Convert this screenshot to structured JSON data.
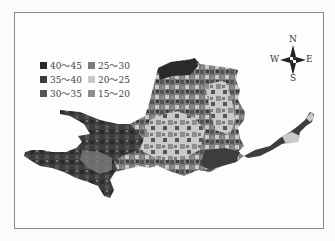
{
  "legend": {
    "items": [
      {
        "label": "40～45",
        "color": "#2a2a2a"
      },
      {
        "label": "35～40",
        "color": "#3d3d3d"
      },
      {
        "label": "30～35",
        "color": "#555555"
      },
      {
        "label": "25～30",
        "color": "#7a7a7a"
      },
      {
        "label": "20～25",
        "color": "#c9c9c9"
      },
      {
        "label": "15～20",
        "color": "#8e8e8e"
      }
    ]
  },
  "compass": {
    "n": "N",
    "s": "S",
    "e": "E",
    "w": "W"
  }
}
